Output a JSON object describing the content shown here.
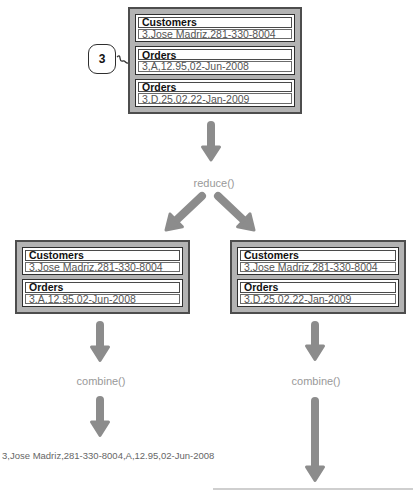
{
  "diagram": {
    "key_bubble": "3",
    "labels": {
      "reduce": "reduce()",
      "combine_left": "combine()",
      "combine_right": "combine()"
    },
    "top_box": {
      "records": [
        {
          "header": "Customers",
          "value": "3,Jose Madriz,281-330-8004"
        },
        {
          "header": "Orders",
          "value": "3,A,12.95,02-Jun-2008"
        },
        {
          "header": "Orders",
          "value": "3,D,25.02,22-Jan-2009"
        }
      ]
    },
    "left_box": {
      "records": [
        {
          "header": "Customers",
          "value": "3,Jose Madriz,281-330-8004"
        },
        {
          "header": "Orders",
          "value": "3,A,12.95,02-Jun-2008"
        }
      ]
    },
    "right_box": {
      "records": [
        {
          "header": "Customers",
          "value": "3,Jose Madriz,281-330-8004"
        },
        {
          "header": "Orders",
          "value": "3,D,25.02,22-Jan-2009"
        }
      ]
    },
    "output_left": "3,Jose Madriz,281-330-8004,A,12.95,02-Jun-2008",
    "colors": {
      "box_fill": "#b3b3b3",
      "box_border": "#4d4d4d",
      "arrow": "#8c8c8c",
      "label_text": "#999999",
      "value_text": "#555555",
      "header_text": "#111111",
      "output_text": "#666666"
    }
  }
}
